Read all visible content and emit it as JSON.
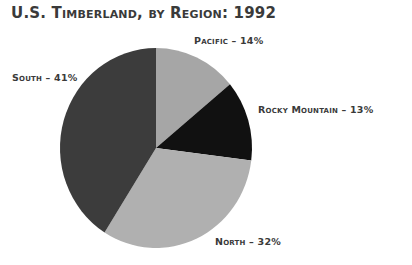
{
  "chart_data": {
    "type": "pie",
    "title": "U.S. Timberland, by Region: 1992",
    "categories": [
      "Pacific",
      "Rocky Mountain",
      "North",
      "South"
    ],
    "values": [
      14,
      13,
      32,
      41
    ],
    "unit": "%",
    "labels": [
      "Pacific – 14%",
      "Rocky Mountain – 13%",
      "North – 32%",
      "South – 41%"
    ],
    "colors": [
      "#a6a6a6",
      "#111111",
      "#b0b0b0",
      "#3c3c3c"
    ],
    "start_angle": "12 o'clock, clockwise",
    "legend": "none (direct labels)"
  },
  "labels": {
    "pacific": "Pacific – 14%",
    "rocky": "Rocky Mountain – 13%",
    "north": "North – 32%",
    "south": "South – 41%"
  }
}
